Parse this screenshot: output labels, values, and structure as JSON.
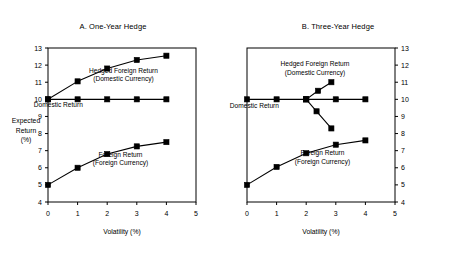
{
  "figure": {
    "background": "#ffffff",
    "ink": "#000000"
  },
  "chart_data": [
    {
      "type": "line",
      "panel": "A",
      "title": "A. One-Year Hedge",
      "xlabel": "Volatility (%)",
      "ylabel": "Expected Return (%)",
      "ylabel_lines": [
        "Expected",
        "Return",
        "(%)"
      ],
      "xlim": [
        0,
        5
      ],
      "ylim": [
        4,
        13
      ],
      "xticks": [
        0,
        1,
        2,
        3,
        4,
        5
      ],
      "yticks": [
        4,
        5,
        6,
        7,
        8,
        9,
        10,
        11,
        12,
        13
      ],
      "xticklabels": [
        "0",
        "1",
        "2",
        "3",
        "4",
        "5"
      ],
      "yticklabels": [
        "4",
        "5",
        "6",
        "7",
        "8",
        "9",
        "10",
        "11",
        "12",
        "13"
      ],
      "grid": false,
      "legend": "annotations",
      "yaxis_side": "left",
      "marker": "square",
      "series": [
        {
          "name": "Hedged Foreign Return (Domestic Currency)",
          "label_lines": [
            "Hedged Foreign Return",
            "(Domestic Currency)"
          ],
          "x": [
            0,
            1,
            2,
            3,
            4
          ],
          "values": [
            10.0,
            11.05,
            11.8,
            12.3,
            12.55
          ]
        },
        {
          "name": "Domestic Return",
          "label_lines": [
            "Domestic Return"
          ],
          "x": [
            0,
            1,
            2,
            3,
            4
          ],
          "values": [
            10.0,
            10.0,
            10.0,
            10.0,
            10.0
          ]
        },
        {
          "name": "Foreign Return (Foreign Currency)",
          "label_lines": [
            "Foreign Return",
            "(Foreign Currency)"
          ],
          "x": [
            0,
            1,
            2,
            3,
            4
          ],
          "values": [
            5.0,
            6.0,
            6.8,
            7.25,
            7.5
          ]
        }
      ],
      "annotations": [
        {
          "text": "Hedged Foreign Return",
          "x": 2.55,
          "y": 11.55
        },
        {
          "text": "(Domestic Currency)",
          "x": 2.55,
          "y": 11.05
        },
        {
          "text": "Domestic Return",
          "x": 0.35,
          "y": 9.55
        },
        {
          "text": "Foreign Return",
          "x": 2.45,
          "y": 6.65
        },
        {
          "text": "(Foreign Currency)",
          "x": 2.45,
          "y": 6.15
        }
      ]
    },
    {
      "type": "line",
      "panel": "B",
      "title": "B. Three-Year Hedge",
      "xlabel": "Volatility (%)",
      "ylabel": "",
      "xlim": [
        0,
        5
      ],
      "ylim": [
        4,
        13
      ],
      "xticks": [
        0,
        1,
        2,
        3,
        4,
        5
      ],
      "yticks": [
        4,
        5,
        6,
        7,
        8,
        9,
        10,
        11,
        12,
        13
      ],
      "xticklabels": [
        "0",
        "1",
        "2",
        "3",
        "4",
        "5"
      ],
      "yticklabels": [
        "4",
        "5",
        "6",
        "7",
        "8",
        "9",
        "10",
        "11",
        "12",
        "13"
      ],
      "grid": false,
      "legend": "annotations",
      "yaxis_side": "right",
      "marker": "square",
      "series": [
        {
          "name": "Domestic Return",
          "label_lines": [
            "Domestic Return"
          ],
          "x": [
            0,
            1,
            2,
            3,
            4
          ],
          "values": [
            10.0,
            10.0,
            10.0,
            10.0,
            10.0
          ]
        },
        {
          "name": "Hedged Foreign Return (Domestic Currency) upper branch",
          "label_lines": [
            "Hedged Foreign Return",
            "(Domestic Currency)"
          ],
          "x": [
            2,
            2.4,
            2.85
          ],
          "values": [
            10.0,
            10.5,
            11.0
          ]
        },
        {
          "name": "Hedged Foreign Return (Domestic Currency) lower branch",
          "label_lines": [],
          "x": [
            2,
            2.35,
            2.85
          ],
          "values": [
            10.0,
            9.3,
            8.3
          ]
        },
        {
          "name": "Foreign Return (Foreign Currency)",
          "label_lines": [
            "Foreign Return",
            "(Foreign Currency)"
          ],
          "x": [
            0,
            1,
            2,
            3,
            4
          ],
          "values": [
            5.0,
            6.05,
            6.85,
            7.35,
            7.6
          ]
        }
      ],
      "annotations": [
        {
          "text": "Hedged Foreign Return",
          "x": 2.3,
          "y": 11.95
        },
        {
          "text": "(Domestic Currency)",
          "x": 2.3,
          "y": 11.45
        },
        {
          "text": "Domestic Return",
          "x": 0.25,
          "y": 9.5
        },
        {
          "text": "Foreign Return",
          "x": 2.55,
          "y": 6.75
        },
        {
          "text": "(Foreign Currency)",
          "x": 2.55,
          "y": 6.25
        }
      ]
    }
  ]
}
